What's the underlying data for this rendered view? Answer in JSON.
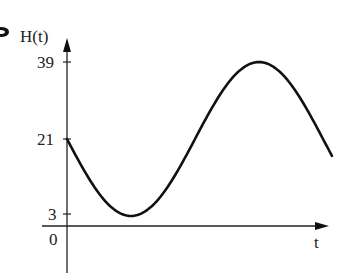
{
  "chart_data": {
    "type": "line",
    "title": "",
    "xlabel": "t",
    "ylabel": "H(t)",
    "y_ticks": [
      3,
      21,
      39
    ],
    "y_tick_labels": [
      "3",
      "21",
      "39"
    ],
    "x_tick_labels": [
      "0"
    ],
    "origin_label": "0",
    "function": "H(t) = 21 - 18 sin(2πt/P)",
    "midline": 21,
    "amplitude": 18,
    "min": 3,
    "max": 39,
    "x": [
      0,
      0.125,
      0.25,
      0.375,
      0.5,
      0.625,
      0.75,
      0.875,
      1.0
    ],
    "x_unit": "fraction of period",
    "values": [
      21,
      8.3,
      3,
      8.3,
      21,
      33.7,
      39,
      33.7,
      21
    ],
    "grid": false,
    "legend": null
  },
  "axes": {
    "y_label": "H(t)",
    "x_label": "t",
    "origin": "0",
    "ticks": {
      "top": "39",
      "mid": "21",
      "bottom": "3"
    }
  },
  "colors": {
    "curve": "#111111",
    "axis": "#222222",
    "background": "#ffffff"
  }
}
